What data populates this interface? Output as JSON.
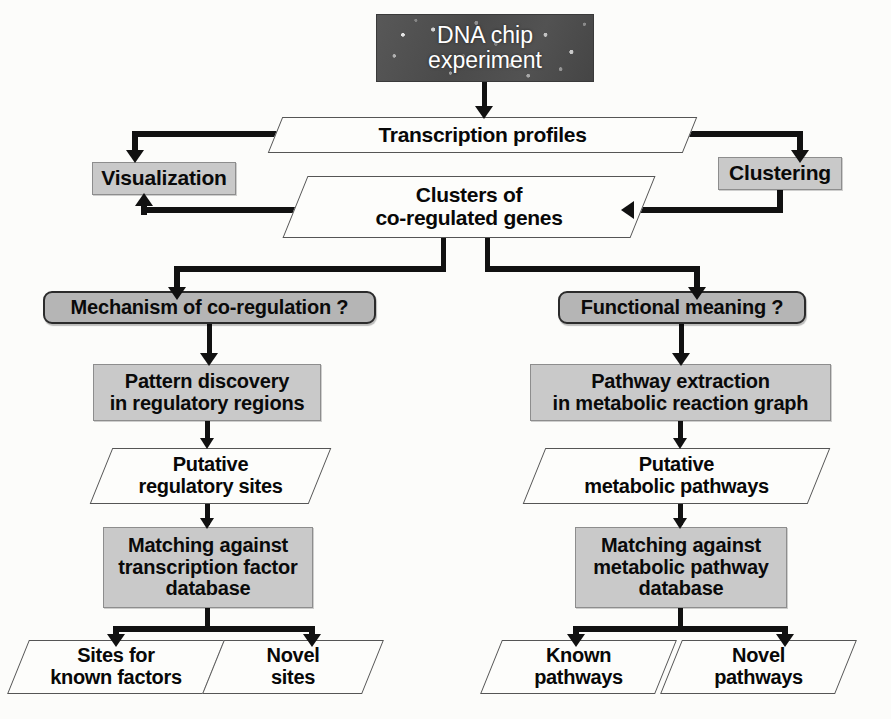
{
  "diagram": {
    "colors": {
      "process_fill": "#c9c9c9",
      "decision_fill": "#b5b5b5",
      "data_fill": "#fdfdfb",
      "line": "#111111",
      "chip_fill": "#4e4e4e"
    }
  },
  "nodes": {
    "dna_chip": {
      "label": "DNA chip\nexperiment",
      "type": "image-box"
    },
    "transcription_profiles": {
      "label": "Transcription profiles",
      "type": "data"
    },
    "visualization": {
      "label": "Visualization",
      "type": "process"
    },
    "clustering": {
      "label": "Clustering",
      "type": "process"
    },
    "clusters": {
      "label": "Clusters of\nco-regulated genes",
      "type": "data"
    },
    "mechanism_question": {
      "label": "Mechanism of co-regulation ?",
      "type": "decision"
    },
    "functional_question": {
      "label": "Functional meaning ?",
      "type": "decision"
    },
    "pattern_discovery": {
      "label": "Pattern discovery\nin regulatory regions",
      "type": "process"
    },
    "pathway_extraction": {
      "label": "Pathway extraction\nin metabolic reaction graph",
      "type": "process"
    },
    "putative_sites": {
      "label": "Putative\nregulatory sites",
      "type": "data"
    },
    "putative_pathways": {
      "label": "Putative\nmetabolic pathways",
      "type": "data"
    },
    "matching_tf": {
      "label": "Matching against\ntranscription factor\ndatabase",
      "type": "process"
    },
    "matching_pathway": {
      "label": "Matching against\nmetabolic pathway\ndatabase",
      "type": "process"
    },
    "sites_known": {
      "label": "Sites for\nknown factors",
      "type": "data"
    },
    "novel_sites": {
      "label": "Novel\nsites",
      "type": "data"
    },
    "known_pathways": {
      "label": "Known\npathways",
      "type": "data"
    },
    "novel_pathways": {
      "label": "Novel\npathways",
      "type": "data"
    }
  }
}
